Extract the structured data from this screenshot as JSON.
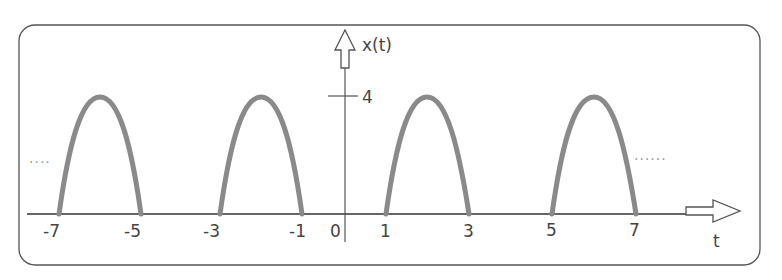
{
  "diagram": {
    "y_axis_label": "x(t)",
    "x_axis_label": "t",
    "y_tick": {
      "value": 4,
      "label": "4"
    },
    "x_ticks": [
      {
        "t": -7,
        "label": "-7"
      },
      {
        "t": -5,
        "label": "-5"
      },
      {
        "t": -3,
        "label": "-3"
      },
      {
        "t": -1,
        "label": "-1"
      },
      {
        "t": 0,
        "label": "0"
      },
      {
        "t": 1,
        "label": "1"
      },
      {
        "t": 3,
        "label": "3"
      },
      {
        "t": 5,
        "label": "5"
      },
      {
        "t": 7,
        "label": "7"
      }
    ],
    "pulses": [
      {
        "start": -7,
        "end": -5,
        "peak": 4
      },
      {
        "start": -3,
        "end": -1,
        "peak": 4
      },
      {
        "start": 1,
        "end": 3,
        "peak": 4
      },
      {
        "start": 5,
        "end": 7,
        "peak": 4
      }
    ],
    "continuation_left": "....",
    "continuation_right": "......",
    "colors": {
      "pulse": "#8a8a8a",
      "axis": "#555555",
      "frame": "#555555",
      "text": "#444444"
    }
  }
}
